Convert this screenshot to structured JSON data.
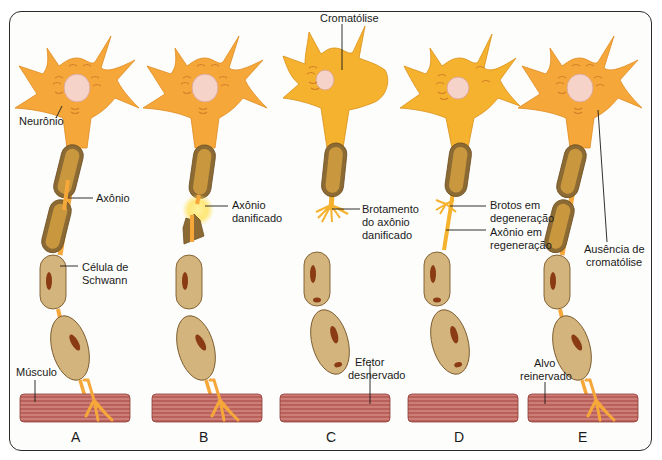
{
  "figure": {
    "colors": {
      "neuron": "#f6a73a",
      "neuron_C": "#f5b22e",
      "nucleus": "#f6d3c8",
      "myelin_outer": "#8c6a34",
      "myelin_inner": "#c8973e",
      "schwann": "#d2b47c",
      "schwann_nucleus": "#8a3b12",
      "muscle": "#b9605a",
      "muscle_stripe": "#e3a39c",
      "damage_glow": "#ffe15a",
      "frame": "#2a2a2a"
    },
    "panels": [
      {
        "id": "A",
        "letter": "A",
        "labels": [
          "Neurônio",
          "Axônio",
          "Célula de",
          "Schwann",
          "Músculo"
        ]
      },
      {
        "id": "B",
        "letter": "B",
        "labels": [
          "Axônio",
          "danificado"
        ]
      },
      {
        "id": "C",
        "letter": "C",
        "labels": [
          "Cromatólise",
          "Brotamento",
          "do axônio",
          "danificado",
          "Efetor",
          "desnervado"
        ]
      },
      {
        "id": "D",
        "letter": "D",
        "labels": [
          "Brotos em",
          "degeneração",
          "Axônio em",
          "regeneração"
        ]
      },
      {
        "id": "E",
        "letter": "E",
        "labels": [
          "Ausência de",
          "cromatólise",
          "Alvo",
          "reinervado"
        ]
      }
    ]
  }
}
